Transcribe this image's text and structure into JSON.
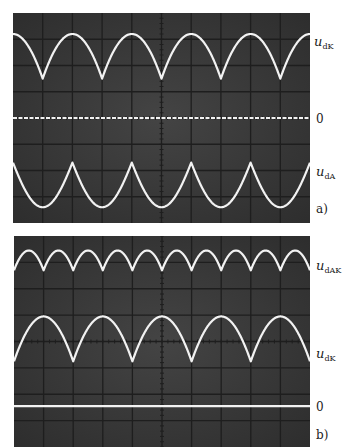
{
  "colors": {
    "screen": "#3a3a3a",
    "grid": "#1e1e1e",
    "trace": "#f2f2f2",
    "label": "#222222"
  },
  "chart_data": [
    {
      "type": "line",
      "panel_label": "a)",
      "title": "",
      "xlabel": "",
      "ylabel": "",
      "grid": true,
      "grid_divisions": {
        "x": 10,
        "y": 8
      },
      "xlim": [
        0,
        10
      ],
      "ylim": [
        0,
        8
      ],
      "units": "oscilloscope divisions",
      "series": [
        {
          "name": "u_dK",
          "label_main": "u",
          "label_sub": "dK",
          "shape": "full-wave rectified (cusps at bottom)",
          "peak": 7.2,
          "cusp": 5.5,
          "period": 2,
          "cusp_positions": [
            1,
            3,
            5,
            7,
            9
          ],
          "style": "solid"
        },
        {
          "name": "0",
          "label_main": "0",
          "label_sub": "",
          "shape": "zero line",
          "level": 4.0,
          "style": "dashed"
        },
        {
          "name": "u_dA",
          "label_main": "u",
          "label_sub": "dA",
          "shape": "inverted full-wave rectified (cusps at top)",
          "peak": 2.3,
          "cusp": 2.3,
          "valley": 0.6,
          "period": 2,
          "cusp_positions": [
            0,
            2,
            4,
            6,
            8,
            10
          ],
          "style": "solid"
        }
      ]
    },
    {
      "type": "line",
      "panel_label": "b)",
      "title": "",
      "xlabel": "",
      "ylabel": "",
      "grid": true,
      "grid_divisions": {
        "x": 10,
        "y": 8
      },
      "xlim": [
        0,
        10
      ],
      "ylim": [
        0,
        8
      ],
      "units": "oscilloscope divisions",
      "series": [
        {
          "name": "u_dAK",
          "label_main": "u",
          "label_sub": "dAK",
          "shape": "full-wave rectified, double frequency (cusps at bottom)",
          "peak": 7.45,
          "cusp": 6.7,
          "period": 1,
          "cusp_positions": [
            1,
            2,
            3,
            4,
            5,
            6,
            7,
            8,
            9
          ],
          "style": "solid"
        },
        {
          "name": "u_dK",
          "label_main": "u",
          "label_sub": "dK",
          "shape": "full-wave rectified (cusps at bottom)",
          "peak": 4.95,
          "cusp": 3.25,
          "period": 2,
          "cusp_positions": [
            0,
            2,
            4,
            6,
            8,
            10
          ],
          "style": "solid"
        },
        {
          "name": "0",
          "label_main": "0",
          "label_sub": "",
          "shape": "zero line",
          "level": 1.55,
          "style": "solid"
        }
      ]
    }
  ]
}
